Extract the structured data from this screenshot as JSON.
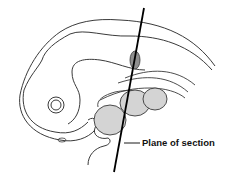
{
  "diagram": {
    "labels": {
      "plane_of_section": "Plane of section"
    },
    "colors": {
      "outline": "#3a3a3a",
      "section_line": "#000000",
      "organ_fill": "#d4d4d4",
      "dark_organ_fill": "#8f8f8f",
      "background": "#ffffff"
    }
  }
}
